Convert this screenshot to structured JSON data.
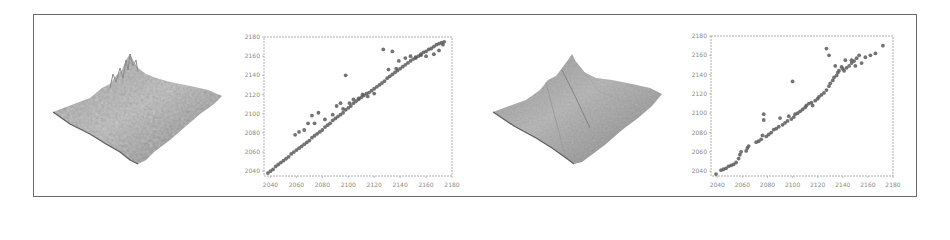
{
  "figure": {
    "panels": [
      {
        "type": "3d-surface",
        "label": "terrain-surface-1",
        "shading": "fine rugged"
      },
      {
        "type": "scatter",
        "label": "scatter-plot-1"
      },
      {
        "type": "3d-surface",
        "label": "terrain-surface-2",
        "shading": "smoothed faceted"
      },
      {
        "type": "scatter",
        "label": "scatter-plot-2"
      }
    ]
  },
  "colors": {
    "frame": "#6a6a6a",
    "axis": "#9a9a9a",
    "tick_text": "#8a8a8a",
    "point": "#5a5a5a",
    "surface_light": "#bdbdbd",
    "surface_dark": "#6e6e6e"
  },
  "chart_data": [
    {
      "type": "scatter",
      "title": "",
      "xlabel": "",
      "ylabel": "",
      "xlim": [
        2035,
        2180
      ],
      "ylim": [
        2035,
        2180
      ],
      "xticks": [
        "2040",
        "2060",
        "2080",
        "2100",
        "2120",
        "2140",
        "2160",
        "2180"
      ],
      "yticks": [
        "2040",
        "2060",
        "2080",
        "2100",
        "2120",
        "2140",
        "2160",
        "2180"
      ],
      "grid": false,
      "legend": null,
      "series": [
        {
          "name": "dense points along y=x",
          "points": [
            [
              2038,
              2038
            ],
            [
              2040,
              2040
            ],
            [
              2042,
              2042
            ],
            [
              2044,
              2045
            ],
            [
              2046,
              2047
            ],
            [
              2048,
              2049
            ],
            [
              2050,
              2051
            ],
            [
              2052,
              2053
            ],
            [
              2054,
              2055
            ],
            [
              2056,
              2058
            ],
            [
              2058,
              2060
            ],
            [
              2060,
              2062
            ],
            [
              2062,
              2064
            ],
            [
              2064,
              2066
            ],
            [
              2066,
              2068
            ],
            [
              2068,
              2070
            ],
            [
              2070,
              2072
            ],
            [
              2072,
              2075
            ],
            [
              2074,
              2077
            ],
            [
              2076,
              2079
            ],
            [
              2078,
              2081
            ],
            [
              2080,
              2083
            ],
            [
              2082,
              2086
            ],
            [
              2084,
              2088
            ],
            [
              2086,
              2090
            ],
            [
              2088,
              2093
            ],
            [
              2090,
              2095
            ],
            [
              2092,
              2097
            ],
            [
              2094,
              2099
            ],
            [
              2096,
              2101
            ],
            [
              2098,
              2104
            ],
            [
              2100,
              2106
            ],
            [
              2102,
              2108
            ],
            [
              2104,
              2111
            ],
            [
              2106,
              2113
            ],
            [
              2108,
              2115
            ],
            [
              2110,
              2117
            ],
            [
              2112,
              2119
            ],
            [
              2114,
              2121
            ],
            [
              2116,
              2122
            ],
            [
              2118,
              2124
            ],
            [
              2120,
              2126
            ],
            [
              2122,
              2128
            ],
            [
              2124,
              2130
            ],
            [
              2126,
              2132
            ],
            [
              2128,
              2134
            ],
            [
              2130,
              2137
            ],
            [
              2132,
              2139
            ],
            [
              2134,
              2141
            ],
            [
              2136,
              2143
            ],
            [
              2138,
              2145
            ],
            [
              2140,
              2147
            ],
            [
              2142,
              2149
            ],
            [
              2144,
              2151
            ],
            [
              2146,
              2153
            ],
            [
              2148,
              2155
            ],
            [
              2150,
              2157
            ],
            [
              2152,
              2159
            ],
            [
              2154,
              2160
            ],
            [
              2156,
              2162
            ],
            [
              2158,
              2164
            ],
            [
              2160,
              2165
            ],
            [
              2162,
              2167
            ],
            [
              2164,
              2168
            ],
            [
              2166,
              2170
            ],
            [
              2168,
              2172
            ],
            [
              2170,
              2173
            ],
            [
              2172,
              2174
            ],
            [
              2174,
              2175
            ]
          ]
        },
        {
          "name": "outliers",
          "points": [
            [
              2059,
              2078
            ],
            [
              2062,
              2081
            ],
            [
              2066,
              2083
            ],
            [
              2069,
              2090
            ],
            [
              2072,
              2098
            ],
            [
              2074,
              2090
            ],
            [
              2077,
              2101
            ],
            [
              2082,
              2094
            ],
            [
              2088,
              2099
            ],
            [
              2091,
              2108
            ],
            [
              2094,
              2111
            ],
            [
              2096,
              2105
            ],
            [
              2098,
              2140
            ],
            [
              2101,
              2111
            ],
            [
              2104,
              2115
            ],
            [
              2108,
              2116
            ],
            [
              2111,
              2120
            ],
            [
              2115,
              2118
            ],
            [
              2120,
              2121
            ],
            [
              2127,
              2167
            ],
            [
              2131,
              2146
            ],
            [
              2134,
              2165
            ],
            [
              2137,
              2147
            ],
            [
              2139,
              2155
            ],
            [
              2144,
              2158
            ],
            [
              2148,
              2160
            ],
            [
              2152,
              2158
            ],
            [
              2156,
              2161
            ],
            [
              2160,
              2160
            ],
            [
              2166,
              2162
            ],
            [
              2170,
              2166
            ],
            [
              2173,
              2172
            ]
          ]
        }
      ]
    },
    {
      "type": "scatter",
      "title": "",
      "xlabel": "",
      "ylabel": "",
      "xlim": [
        2035,
        2180
      ],
      "ylim": [
        2035,
        2180
      ],
      "xticks": [
        "2040",
        "2060",
        "2080",
        "2100",
        "2120",
        "2140",
        "2160",
        "2180"
      ],
      "yticks": [
        "2040",
        "2060",
        "2080",
        "2100",
        "2120",
        "2140",
        "2160",
        "2180"
      ],
      "grid": false,
      "legend": null,
      "series": [
        {
          "name": "points",
          "points": [
            [
              2039,
              2037
            ],
            [
              2043,
              2041
            ],
            [
              2045,
              2042
            ],
            [
              2047,
              2043
            ],
            [
              2049,
              2045
            ],
            [
              2051,
              2046
            ],
            [
              2053,
              2047
            ],
            [
              2055,
              2049
            ],
            [
              2057,
              2053
            ],
            [
              2058,
              2057
            ],
            [
              2059,
              2060
            ],
            [
              2063,
              2061
            ],
            [
              2064,
              2064
            ],
            [
              2065,
              2066
            ],
            [
              2071,
              2070
            ],
            [
              2073,
              2071
            ],
            [
              2075,
              2073
            ],
            [
              2076,
              2077
            ],
            [
              2077,
              2093
            ],
            [
              2077,
              2099
            ],
            [
              2079,
              2076
            ],
            [
              2081,
              2078
            ],
            [
              2083,
              2080
            ],
            [
              2085,
              2083
            ],
            [
              2087,
              2084
            ],
            [
              2089,
              2086
            ],
            [
              2090,
              2095
            ],
            [
              2092,
              2088
            ],
            [
              2094,
              2090
            ],
            [
              2096,
              2092
            ],
            [
              2097,
              2097
            ],
            [
              2099,
              2094
            ],
            [
              2101,
              2096
            ],
            [
              2102,
              2099
            ],
            [
              2104,
              2100
            ],
            [
              2106,
              2102
            ],
            [
              2108,
              2104
            ],
            [
              2110,
              2106
            ],
            [
              2111,
              2108
            ],
            [
              2113,
              2110
            ],
            [
              2115,
              2111
            ],
            [
              2116,
              2108
            ],
            [
              2118,
              2113
            ],
            [
              2120,
              2115
            ],
            [
              2121,
              2117
            ],
            [
              2123,
              2119
            ],
            [
              2125,
              2121
            ],
            [
              2127,
              2124
            ],
            [
              2129,
              2128
            ],
            [
              2130,
              2131
            ],
            [
              2132,
              2134
            ],
            [
              2133,
              2137
            ],
            [
              2135,
              2139
            ],
            [
              2136,
              2142
            ],
            [
              2137,
              2144
            ],
            [
              2139,
              2148
            ],
            [
              2140,
              2146
            ],
            [
              2141,
              2144
            ],
            [
              2143,
              2147
            ],
            [
              2145,
              2149
            ],
            [
              2147,
              2152
            ],
            [
              2149,
              2154
            ],
            [
              2151,
              2157
            ],
            [
              2153,
              2160
            ],
            [
              2155,
              2152
            ],
            [
              2158,
              2158
            ],
            [
              2162,
              2160
            ],
            [
              2166,
              2162
            ],
            [
              2172,
              2170
            ],
            [
              2100,
              2133
            ],
            [
              2127,
              2167
            ],
            [
              2129,
              2160
            ],
            [
              2134,
              2149
            ],
            [
              2142,
              2155
            ],
            [
              2147,
              2155
            ],
            [
              2150,
              2149
            ]
          ]
        }
      ]
    }
  ]
}
